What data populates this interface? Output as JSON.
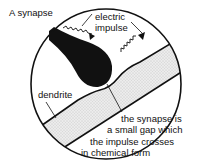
{
  "diagram": {
    "title": "A synapse",
    "labels": {
      "impulse_line1": "electric",
      "impulse_line2": "impulse",
      "dendrite": "dendrite",
      "gap_line1": "the synapse is",
      "gap_line2": "a small gap which",
      "gap_line3": "the impulse crosses",
      "gap_line4": "in chemical form"
    },
    "colors": {
      "ink": "#111111",
      "dendrite_fill": "#e4e4e4",
      "background": "#ffffff"
    }
  }
}
